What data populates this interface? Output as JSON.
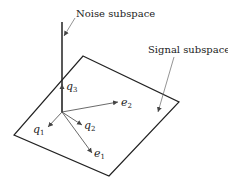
{
  "labels": {
    "noise": "Noise subspace",
    "signal": "Signal subspace"
  },
  "vectors": [
    {
      "name": "q",
      "sub": "3"
    },
    {
      "name": "e",
      "sub": "2"
    },
    {
      "name": "q",
      "sub": "2"
    },
    {
      "name": "q",
      "sub": "1"
    },
    {
      "name": "e",
      "sub": "1"
    }
  ]
}
